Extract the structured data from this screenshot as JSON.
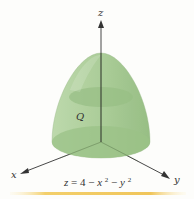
{
  "diagram": {
    "type": "3d-solid",
    "region_label": "Q",
    "equation": {
      "lhs": "z",
      "rhs_parts": [
        "4",
        "x",
        "2",
        "y",
        "2"
      ],
      "text": "z = 4 − x² − y²"
    },
    "axes": {
      "x_label": "x",
      "y_label": "y",
      "z_label": "z"
    },
    "colors": {
      "solid_fill": "#9fc48a",
      "solid_dark": "#7fac6a",
      "cross_section": "#8db876",
      "axis": "#333333",
      "footer_strip": "#f2c94c"
    }
  }
}
